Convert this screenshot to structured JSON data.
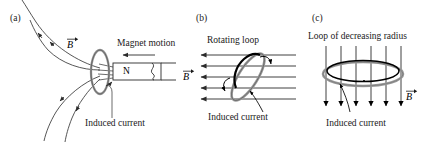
{
  "figure": {
    "title_visible": false,
    "panels": [
      {
        "tag": "(a)",
        "name": "bar-magnet-moving-into-coil",
        "labels": {
          "b_field": "B",
          "magnet_motion": "Magnet motion",
          "induced_current": "Induced current",
          "magnet_pole": "N"
        },
        "field_lines": 4,
        "arrow_direction": "outward-left",
        "motion_arrow_direction": "left"
      },
      {
        "tag": "(b)",
        "name": "rotating-loop-in-uniform-field",
        "labels": {
          "heading": "Rotating loop",
          "b_field": "B",
          "induced_current": "Induced current"
        },
        "field_lines": 5,
        "arrow_direction": "left",
        "loop_rotation_deg": -58
      },
      {
        "tag": "(c)",
        "name": "loop-of-decreasing-radius",
        "labels": {
          "heading": "Loop of decreasing radius",
          "b_field": "B",
          "induced_current": "Induced current"
        },
        "field_lines": 6,
        "arrow_direction": "down"
      }
    ]
  },
  "colors": {
    "ink": "#1a1a1a",
    "line": "#2b2b2b",
    "loop_gray": "#9a9a9a",
    "magnet_fill": "#ffffff",
    "background": "#ffffff"
  }
}
